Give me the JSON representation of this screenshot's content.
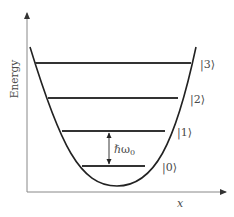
{
  "diagram": {
    "axes": {
      "y_label": "Energy",
      "x_label": "x"
    },
    "levels": [
      {
        "label": "|0⟩",
        "y": 166,
        "x1": 82,
        "x2": 145,
        "label_x": 162,
        "label_y": 171
      },
      {
        "label": "|1⟩",
        "y": 131,
        "x1": 62,
        "x2": 165,
        "label_x": 177,
        "label_y": 136
      },
      {
        "label": "|2⟩",
        "y": 98,
        "x1": 48,
        "x2": 178,
        "label_x": 190,
        "label_y": 103
      },
      {
        "label": "|3⟩",
        "y": 63,
        "x1": 35,
        "x2": 191,
        "label_x": 200,
        "label_y": 68
      }
    ],
    "spacing_annotation": {
      "label": "ℏω",
      "subscript": "0"
    },
    "colors": {
      "axis": "#888888",
      "curve": "#222222",
      "level": "#333333",
      "text": "#4a4a4a"
    }
  }
}
